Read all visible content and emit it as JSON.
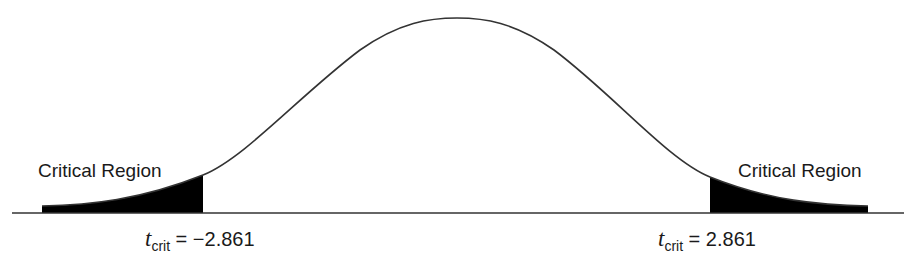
{
  "diagram": {
    "type": "t-distribution two-tailed critical regions",
    "colors": {
      "curve": "#333333",
      "fill": "#000000",
      "axis": "#333333",
      "background": "#ffffff"
    },
    "left_region": {
      "label": "Critical Region",
      "t_symbol": "t",
      "t_subscript": "crit",
      "equals": " = ",
      "value": "−2.861"
    },
    "right_region": {
      "label": "Critical Region",
      "t_symbol": "t",
      "t_subscript": "crit",
      "equals": " = ",
      "value": "2.861"
    }
  }
}
